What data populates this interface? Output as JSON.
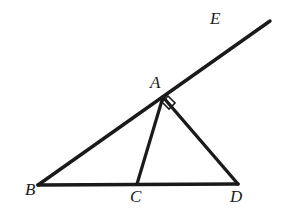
{
  "figure": {
    "background_color": "#ffffff",
    "stroke_color": "#1a1a1a",
    "canvas": {
      "width": 282,
      "height": 219
    },
    "points": [
      {
        "id": "A",
        "label": "A",
        "x": 163,
        "y": 97,
        "label_x": 150,
        "label_y": 74
      },
      {
        "id": "B",
        "label": "B",
        "x": 38,
        "y": 185,
        "label_x": 25,
        "label_y": 181
      },
      {
        "id": "C",
        "label": "C",
        "x": 137,
        "y": 184,
        "label_x": 130,
        "label_y": 188
      },
      {
        "id": "D",
        "label": "D",
        "x": 238,
        "y": 184,
        "label_x": 230,
        "label_y": 188
      },
      {
        "id": "E",
        "label": "E",
        "x": 270,
        "y": 21,
        "label_x": 210,
        "label_y": 10
      }
    ],
    "segments": [
      {
        "id": "ray-BE",
        "from": "B",
        "to": "E",
        "x1": 38,
        "y1": 185,
        "x2": 270,
        "y2": 21,
        "width": 3.4
      },
      {
        "id": "base-BD",
        "from": "B",
        "to": "D",
        "x1": 38,
        "y1": 185,
        "x2": 238,
        "y2": 184,
        "width": 3.6
      },
      {
        "id": "cevian-AC",
        "from": "A",
        "to": "C",
        "x1": 163,
        "y1": 97,
        "x2": 137,
        "y2": 184,
        "width": 3.2
      },
      {
        "id": "side-AD",
        "from": "A",
        "to": "D",
        "x1": 163,
        "y1": 97,
        "x2": 238,
        "y2": 184,
        "width": 3.4
      }
    ],
    "angle_markers": [
      {
        "id": "right-angle-at-A",
        "vertex": "A",
        "type": "right-angle-square",
        "points": "168,96 175,103 169,109 162,102",
        "width": 1.6
      }
    ]
  }
}
